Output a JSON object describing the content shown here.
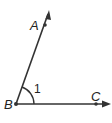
{
  "diagram": {
    "type": "angle",
    "vertex": {
      "label": "B",
      "x": 16,
      "y": 104
    },
    "points": [
      {
        "label": "A",
        "x": 45,
        "y": 25
      },
      {
        "label": "C",
        "x": 96,
        "y": 104
      }
    ],
    "rays": [
      {
        "name": "ray-BA",
        "from": "B",
        "through": "A",
        "tip": {
          "x": 49,
          "y": 12
        }
      },
      {
        "name": "ray-BC",
        "from": "B",
        "through": "C",
        "tip": {
          "x": 110,
          "y": 104
        }
      }
    ],
    "angle_mark": {
      "label": "1",
      "radius": 18
    },
    "labels": {
      "A": "A",
      "B": "B",
      "C": "C",
      "angle": "1"
    },
    "colors": {
      "line": "#333333",
      "background": "#ffffff"
    }
  }
}
